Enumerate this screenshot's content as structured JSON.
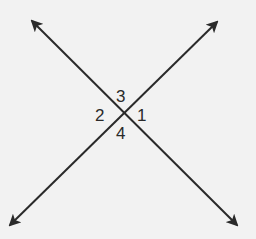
{
  "diagram": {
    "type": "intersecting-lines",
    "line_color": "#2a2a2a",
    "background": "#f2f2f2",
    "lines": [
      {
        "name": "line-a",
        "from": [
          32,
          21
        ],
        "to": [
          237,
          225
        ],
        "arrows": "both"
      },
      {
        "name": "line-b",
        "from": [
          10,
          225
        ],
        "to": [
          217,
          22
        ],
        "arrows": "both"
      }
    ],
    "intersection": [
      122,
      114
    ],
    "angle_labels": {
      "top": "3",
      "right": "1",
      "left": "2",
      "bottom": "4"
    }
  }
}
